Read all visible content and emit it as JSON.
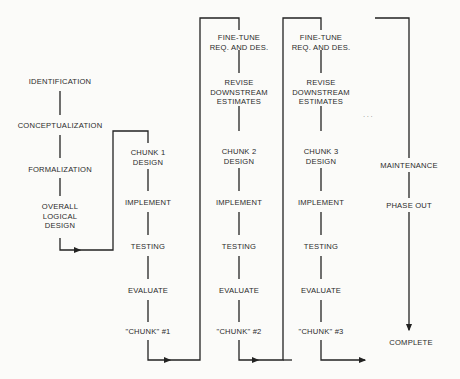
{
  "diagram": {
    "type": "process-flow",
    "ink_color": "#222222",
    "background": "#fbfbf9",
    "phase0": {
      "steps": [
        "IDENTIFICATION",
        "CONCEPTUALIZATION",
        "FORMALIZATION",
        "OVERALL",
        "LOGICAL",
        "DESIGN"
      ]
    },
    "chunk1": {
      "design_l1": "CHUNK 1",
      "design_l2": "DESIGN",
      "implement": "IMPLEMENT",
      "testing": "TESTING",
      "evaluate": "EVALUATE",
      "result": "\"CHUNK\" #1"
    },
    "chunk2": {
      "finetune_l1": "FINE-TUNE",
      "finetune_l2": "REQ. AND DES.",
      "revise_l1": "REVISE",
      "revise_l2": "DOWNSTREAM",
      "revise_l3": "ESTIMATES",
      "design_l1": "CHUNK 2",
      "design_l2": "DESIGN",
      "implement": "IMPLEMENT",
      "testing": "TESTING",
      "evaluate": "EVALUATE",
      "result": "\"CHUNK\" #2"
    },
    "chunk3": {
      "finetune_l1": "FINE-TUNE",
      "finetune_l2": "REQ. AND DES.",
      "revise_l1": "REVISE",
      "revise_l2": "DOWNSTREAM",
      "revise_l3": "ESTIMATES",
      "design_l1": "CHUNK 3",
      "design_l2": "DESIGN",
      "implement": "IMPLEMENT",
      "testing": "TESTING",
      "evaluate": "EVALUATE",
      "result": "\"CHUNK\" #3"
    },
    "ellipsis": ". . .",
    "final": {
      "maintenance": "MAINTENANCE",
      "phase_out": "PHASE OUT",
      "complete": "COMPLETE"
    }
  }
}
